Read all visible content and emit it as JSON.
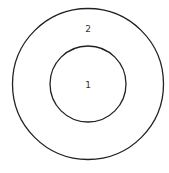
{
  "diagram": {
    "type": "concentric-circles",
    "stroke_color": "#222222",
    "background": "#ffffff",
    "circles": [
      {
        "id": "outer",
        "label": "2",
        "cx": 88,
        "cy": 84,
        "r": 76
      },
      {
        "id": "inner",
        "label": "1",
        "cx": 88,
        "cy": 84,
        "r": 38
      }
    ]
  }
}
